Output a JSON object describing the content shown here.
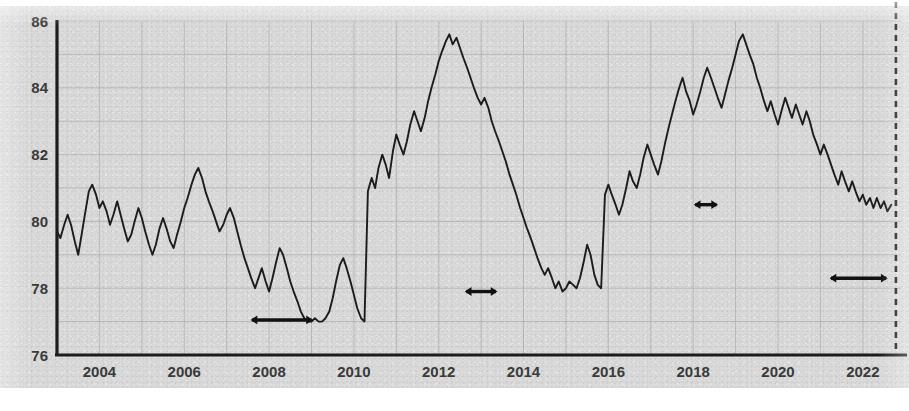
{
  "chart_data": {
    "type": "line",
    "title": "",
    "subtitle": "",
    "xlabel": "",
    "ylabel": "",
    "xlim": [
      2003.0,
      2022.9
    ],
    "ylim": [
      76,
      86
    ],
    "grid": true,
    "legend": "none",
    "y_ticks": [
      "86",
      "84",
      "82",
      "80",
      "78",
      "76"
    ],
    "y_tick_values": [
      86,
      84,
      82,
      80,
      78,
      76
    ],
    "x_ticks": [
      "2004",
      "2006",
      "2008",
      "2010",
      "2012",
      "2014",
      "2016",
      "2018",
      "2020",
      "2022"
    ],
    "x_tick_values": [
      2004,
      2006,
      2008,
      2010,
      2012,
      2014,
      2016,
      2018,
      2020,
      2022
    ],
    "line_color": "#1c1c1c",
    "grid_color": "#a8a8a8",
    "axis_color": "#1c1c1c",
    "background_color": "#d9d9d9",
    "series": [
      {
        "name": "series-1",
        "x": [
          2003.0,
          2003.08,
          2003.17,
          2003.25,
          2003.33,
          2003.42,
          2003.5,
          2003.58,
          2003.67,
          2003.75,
          2003.83,
          2003.92,
          2004.0,
          2004.08,
          2004.17,
          2004.25,
          2004.33,
          2004.42,
          2004.5,
          2004.58,
          2004.67,
          2004.75,
          2004.83,
          2004.92,
          2005.0,
          2005.08,
          2005.17,
          2005.25,
          2005.33,
          2005.42,
          2005.5,
          2005.58,
          2005.67,
          2005.75,
          2005.83,
          2005.92,
          2006.0,
          2006.08,
          2006.17,
          2006.25,
          2006.33,
          2006.42,
          2006.5,
          2006.58,
          2006.67,
          2006.75,
          2006.83,
          2006.92,
          2007.0,
          2007.08,
          2007.17,
          2007.25,
          2007.33,
          2007.42,
          2007.5,
          2007.58,
          2007.67,
          2007.75,
          2007.83,
          2007.92,
          2008.0,
          2008.08,
          2008.17,
          2008.25,
          2008.33,
          2008.42,
          2008.5,
          2008.58,
          2008.67,
          2008.75,
          2008.83,
          2008.92,
          2009.0,
          2009.08,
          2009.17,
          2009.25,
          2009.33,
          2009.42,
          2009.5,
          2009.58,
          2009.67,
          2009.75,
          2009.83,
          2009.92,
          2010.0,
          2010.08,
          2010.17,
          2010.25,
          2010.33,
          2010.42,
          2010.5,
          2010.58,
          2010.67,
          2010.75,
          2010.83,
          2010.92,
          2011.0,
          2011.08,
          2011.17,
          2011.25,
          2011.33,
          2011.42,
          2011.5,
          2011.58,
          2011.67,
          2011.75,
          2011.83,
          2011.92,
          2012.0,
          2012.08,
          2012.17,
          2012.25,
          2012.33,
          2012.42,
          2012.5,
          2012.58,
          2012.67,
          2012.75,
          2012.83,
          2012.92,
          2013.0,
          2013.08,
          2013.17,
          2013.25,
          2013.33,
          2013.42,
          2013.5,
          2013.58,
          2013.67,
          2013.75,
          2013.83,
          2013.92,
          2014.0,
          2014.08,
          2014.17,
          2014.25,
          2014.33,
          2014.42,
          2014.5,
          2014.58,
          2014.67,
          2014.75,
          2014.83,
          2014.92,
          2015.0,
          2015.08,
          2015.17,
          2015.25,
          2015.33,
          2015.42,
          2015.5,
          2015.58,
          2015.67,
          2015.75,
          2015.83,
          2015.92,
          2016.0,
          2016.08,
          2016.17,
          2016.25,
          2016.33,
          2016.42,
          2016.5,
          2016.58,
          2016.67,
          2016.75,
          2016.83,
          2016.92,
          2017.0,
          2017.08,
          2017.17,
          2017.25,
          2017.33,
          2017.42,
          2017.5,
          2017.58,
          2017.67,
          2017.75,
          2017.83,
          2017.92,
          2018.0,
          2018.08,
          2018.17,
          2018.25,
          2018.33,
          2018.42,
          2018.5,
          2018.58,
          2018.67,
          2018.75,
          2018.83,
          2018.92,
          2019.0,
          2019.08,
          2019.17,
          2019.25,
          2019.33,
          2019.42,
          2019.5,
          2019.58,
          2019.67,
          2019.75,
          2019.83,
          2019.92,
          2020.0,
          2020.08,
          2020.17,
          2020.25,
          2020.33,
          2020.42,
          2020.5,
          2020.58,
          2020.67,
          2020.75,
          2020.83,
          2020.92,
          2021.0,
          2021.08,
          2021.17,
          2021.25,
          2021.33,
          2021.42,
          2021.5,
          2021.58,
          2021.67,
          2021.75,
          2021.83,
          2021.92,
          2022.0,
          2022.08,
          2022.17,
          2022.25,
          2022.33,
          2022.42,
          2022.5,
          2022.58,
          2022.67
        ],
        "y": [
          79.7,
          79.5,
          79.9,
          80.2,
          79.9,
          79.4,
          79.0,
          79.6,
          80.3,
          80.9,
          81.1,
          80.8,
          80.4,
          80.6,
          80.3,
          79.9,
          80.2,
          80.6,
          80.2,
          79.8,
          79.4,
          79.6,
          80.0,
          80.4,
          80.1,
          79.7,
          79.3,
          79.0,
          79.3,
          79.8,
          80.1,
          79.8,
          79.4,
          79.2,
          79.6,
          80.0,
          80.4,
          80.7,
          81.1,
          81.4,
          81.6,
          81.3,
          80.9,
          80.6,
          80.3,
          80.0,
          79.7,
          79.9,
          80.2,
          80.4,
          80.1,
          79.7,
          79.3,
          78.9,
          78.6,
          78.3,
          78.0,
          78.3,
          78.6,
          78.2,
          77.9,
          78.3,
          78.8,
          79.2,
          79.0,
          78.6,
          78.2,
          77.9,
          77.6,
          77.3,
          77.1,
          77.0,
          77.0,
          77.1,
          77.0,
          77.0,
          77.1,
          77.3,
          77.7,
          78.2,
          78.7,
          78.9,
          78.6,
          78.2,
          77.8,
          77.4,
          77.1,
          77.0,
          80.9,
          81.3,
          81.0,
          81.6,
          82.0,
          81.7,
          81.3,
          82.1,
          82.6,
          82.3,
          82.0,
          82.4,
          82.9,
          83.3,
          83.0,
          82.7,
          83.1,
          83.6,
          84.0,
          84.4,
          84.8,
          85.1,
          85.4,
          85.6,
          85.3,
          85.5,
          85.2,
          84.9,
          84.6,
          84.3,
          84.0,
          83.7,
          83.5,
          83.7,
          83.4,
          83.0,
          82.7,
          82.4,
          82.1,
          81.8,
          81.4,
          81.1,
          80.8,
          80.4,
          80.1,
          79.8,
          79.5,
          79.2,
          78.9,
          78.6,
          78.4,
          78.6,
          78.3,
          78.0,
          78.2,
          77.9,
          78.0,
          78.2,
          78.1,
          78.0,
          78.3,
          78.8,
          79.3,
          79.0,
          78.4,
          78.1,
          78.0,
          80.8,
          81.1,
          80.8,
          80.5,
          80.2,
          80.5,
          81.0,
          81.5,
          81.2,
          81.0,
          81.4,
          81.9,
          82.3,
          82.0,
          81.7,
          81.4,
          81.8,
          82.3,
          82.8,
          83.2,
          83.6,
          84.0,
          84.3,
          83.9,
          83.6,
          83.2,
          83.5,
          83.9,
          84.3,
          84.6,
          84.3,
          84.0,
          83.7,
          83.4,
          83.8,
          84.2,
          84.6,
          85.0,
          85.4,
          85.6,
          85.3,
          85.0,
          84.7,
          84.3,
          84.0,
          83.6,
          83.3,
          83.6,
          83.2,
          82.9,
          83.3,
          83.7,
          83.4,
          83.1,
          83.5,
          83.2,
          82.9,
          83.3,
          83.0,
          82.6,
          82.3,
          82.0,
          82.3,
          82.0,
          81.7,
          81.4,
          81.1,
          81.5,
          81.2,
          80.9,
          81.2,
          80.9,
          80.6,
          80.8,
          80.5,
          80.7,
          80.4,
          80.7,
          80.4,
          80.6,
          80.3,
          80.5
        ]
      }
    ],
    "annotations": [
      {
        "type": "double-arrow",
        "label": "",
        "x_start": 2007.6,
        "x_end": 2009.0,
        "y": 77.05
      },
      {
        "type": "double-arrow",
        "label": "",
        "x_start": 2012.65,
        "x_end": 2013.35,
        "y": 77.9
      },
      {
        "type": "double-arrow",
        "label": "",
        "x_start": 2018.05,
        "x_end": 2018.55,
        "y": 80.5
      },
      {
        "type": "double-arrow",
        "label": "",
        "x_start": 2021.25,
        "x_end": 2022.55,
        "y": 78.3
      },
      {
        "type": "vertical-dashed-line",
        "label": "",
        "x": 2022.78
      }
    ]
  }
}
